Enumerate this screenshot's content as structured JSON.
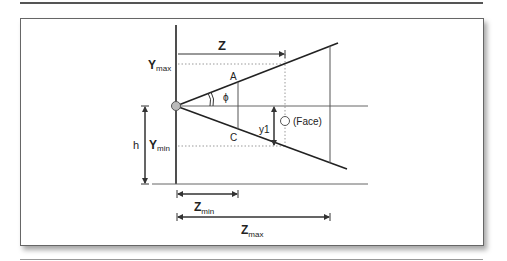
{
  "figure": {
    "labels": {
      "z": "Z",
      "y_max_main": "Y",
      "y_max_sub": "max",
      "y_min_main": "Y",
      "y_min_sub": "min",
      "h": "h",
      "a": "A",
      "c": "C",
      "phi": "ϕ",
      "y1": "y1",
      "face": "(Face)",
      "z_min_main": "Z",
      "z_min_sub": "min",
      "z_max_main": "Z",
      "z_max_sub": "max"
    },
    "colors": {
      "line": "#222222",
      "thin": "#555555",
      "dotted": "#999999",
      "origin_fill": "#bbbbbb"
    }
  }
}
